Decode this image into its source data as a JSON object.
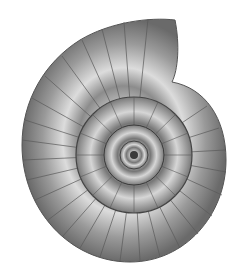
{
  "image": {
    "subject": "ammonite shell illustration",
    "style": "grayscale",
    "background": "#ffffff",
    "colors": {
      "light": "#e6e6e6",
      "mid": "#a8a8a8",
      "dark": "#4a4a4a",
      "shadow": "#2e2e2e"
    }
  }
}
